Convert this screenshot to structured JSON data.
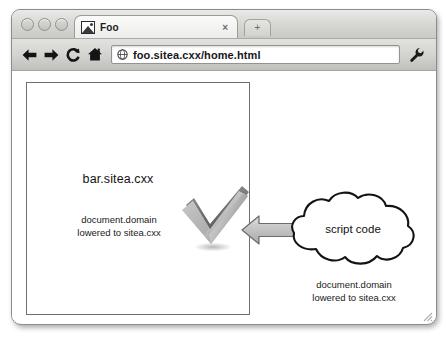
{
  "browser": {
    "window_controls": [
      {
        "name": "close"
      },
      {
        "name": "minimize"
      },
      {
        "name": "maximize"
      }
    ],
    "tab": {
      "title": "Foo",
      "favicon": "image-icon",
      "close_label": "×"
    },
    "new_tab_label": "+",
    "toolbar": {
      "back_label": "←",
      "forward_label": "→",
      "reload_label": "C",
      "home_label": "home-icon",
      "menu_label": "wrench-icon",
      "url": "foo.sitea.cxx/home.html",
      "url_placeholder": "Search or type URL",
      "security_icon": "globe-icon"
    }
  },
  "page": {
    "frame": {
      "domain_label": "bar.sitea.cxx",
      "caption_line1": "document.domain",
      "caption_line2": "lowered to sitea.cxx",
      "status_icon": "checkmark-icon"
    },
    "arrow": {
      "direction": "left",
      "name": "flow-arrow"
    },
    "cloud": {
      "label": "script code",
      "caption_line1": "document.domain",
      "caption_line2": "lowered to sitea.cxx"
    }
  },
  "colors": {
    "chrome_light": "#e9e9e7",
    "chrome_dark": "#bfbfbb",
    "border": "#8c8c8c",
    "text": "#121212",
    "arrow_fill": "#bdbdbd",
    "check_light": "#e2e2e2",
    "check_dark": "#787878"
  }
}
